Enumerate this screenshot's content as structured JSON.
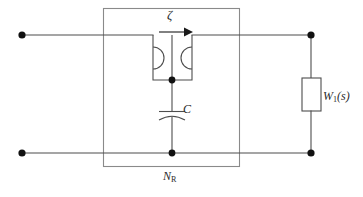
{
  "figure": {
    "type": "circuit-diagram",
    "width": 363,
    "height": 197,
    "background_color": "#ffffff"
  },
  "labels": {
    "zeta": "ζ",
    "capacitor": "C",
    "network_block": "N",
    "network_block_subscript": "R",
    "load_block": "W",
    "load_block_subscript": "1",
    "load_block_arg": "(s)"
  },
  "colors": {
    "wire": "#4d4d4d",
    "boundary": "#8a8a8a",
    "node": "#111111",
    "arrow": "#1a1a1a",
    "text": "#2b2b2b",
    "component_fill": "#ffffff"
  },
  "components": {
    "terminals": [
      {
        "name": "input-terminal-top-left",
        "x": 22,
        "y": 35
      },
      {
        "name": "input-terminal-bottom-left",
        "x": 22,
        "y": 153
      },
      {
        "name": "output-terminal-top-right",
        "x": 311,
        "y": 35
      },
      {
        "name": "output-terminal-bottom-right",
        "x": 311,
        "y": 153
      }
    ],
    "junctions": [
      {
        "name": "nullor-output-junction",
        "x": 172,
        "y": 80
      },
      {
        "name": "ground-rail-junction",
        "x": 172,
        "y": 153
      }
    ],
    "network_box": {
      "name": "resistive-network-box",
      "x": 103,
      "y": 8,
      "width": 137,
      "height": 159
    },
    "nullor": {
      "name": "nullor-symbol",
      "x": 153,
      "y": 35,
      "width": 39,
      "height": 45
    },
    "capacitor": {
      "name": "capacitor-symbol",
      "x": 172,
      "y": 113,
      "plate_half_width": 13
    },
    "load_block": {
      "name": "load-impedance-block",
      "x": 302,
      "y": 78,
      "width": 19,
      "height": 33
    },
    "current_arrow": {
      "name": "zeta-current-arrow",
      "x1": 160,
      "y1": 32,
      "x2": 190,
      "y2": 32
    }
  }
}
